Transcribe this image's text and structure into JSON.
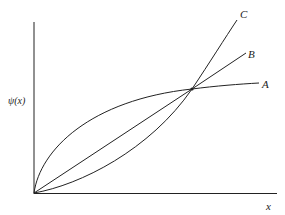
{
  "diagram": {
    "y_axis_label": "ψ(x)",
    "x_axis_label": "x",
    "curves": [
      {
        "name": "A",
        "label": "A",
        "shape": "concave",
        "description": "rises steeply from origin, flattens after intersection"
      },
      {
        "name": "B",
        "label": "B",
        "shape": "linear",
        "description": "straight line from origin through intersection"
      },
      {
        "name": "C",
        "label": "C",
        "shape": "convex",
        "description": "rises slowly from origin, steepens after intersection"
      }
    ],
    "line_color": "#222222",
    "background_color": "#ffffff"
  }
}
